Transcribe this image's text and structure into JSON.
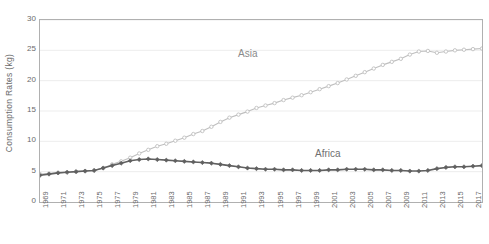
{
  "chart_data": {
    "type": "line",
    "title": "",
    "xlabel": "",
    "ylabel": "Consumption Rates (kg)",
    "ylim": [
      0,
      30
    ],
    "yticks": [
      0,
      5,
      10,
      15,
      20,
      25,
      30
    ],
    "xlim": [
      1969,
      2018
    ],
    "grid": true,
    "legend": "inline-annotations",
    "x": [
      1969,
      1970,
      1971,
      1972,
      1973,
      1974,
      1975,
      1976,
      1977,
      1978,
      1979,
      1980,
      1981,
      1982,
      1983,
      1984,
      1985,
      1986,
      1987,
      1988,
      1989,
      1990,
      1991,
      1992,
      1993,
      1994,
      1995,
      1996,
      1997,
      1998,
      1999,
      2000,
      2001,
      2002,
      2003,
      2004,
      2005,
      2006,
      2007,
      2008,
      2009,
      2010,
      2011,
      2012,
      2013,
      2014,
      2015,
      2016,
      2017,
      2018
    ],
    "xtick_labels": [
      "1969",
      "1971",
      "1973",
      "1975",
      "1977",
      "1979",
      "1981",
      "1983",
      "1985",
      "1987",
      "1989",
      "1991",
      "1993",
      "1995",
      "1997",
      "1999",
      "2001",
      "2003",
      "2005",
      "2007",
      "2009",
      "2011",
      "2013",
      "2015",
      "2017"
    ],
    "series": [
      {
        "name": "Asia",
        "color": "#bfbfbf",
        "marker": "circle-open",
        "values": [
          4.6,
          4.7,
          4.8,
          4.9,
          5.0,
          5.1,
          5.2,
          5.6,
          6.2,
          6.7,
          7.3,
          8.0,
          8.6,
          9.2,
          9.6,
          10.1,
          10.6,
          11.2,
          11.7,
          12.4,
          13.2,
          13.9,
          14.4,
          14.9,
          15.5,
          15.9,
          16.3,
          16.8,
          17.2,
          17.6,
          18.1,
          18.6,
          19.1,
          19.6,
          20.2,
          20.8,
          21.4,
          22.0,
          22.6,
          23.1,
          23.6,
          24.3,
          24.8,
          24.9,
          24.6,
          24.8,
          25.0,
          25.1,
          25.2,
          25.3
        ]
      },
      {
        "name": "Africa",
        "color": "#606060",
        "marker": "diamond-filled",
        "values": [
          4.4,
          4.6,
          4.8,
          4.9,
          5.0,
          5.1,
          5.2,
          5.6,
          6.0,
          6.4,
          6.8,
          7.0,
          7.1,
          7.0,
          6.9,
          6.8,
          6.7,
          6.6,
          6.5,
          6.4,
          6.2,
          6.0,
          5.8,
          5.6,
          5.5,
          5.4,
          5.4,
          5.3,
          5.3,
          5.2,
          5.2,
          5.2,
          5.3,
          5.3,
          5.4,
          5.4,
          5.4,
          5.3,
          5.3,
          5.2,
          5.2,
          5.1,
          5.1,
          5.2,
          5.5,
          5.7,
          5.8,
          5.8,
          5.9,
          6.0
        ]
      }
    ]
  }
}
